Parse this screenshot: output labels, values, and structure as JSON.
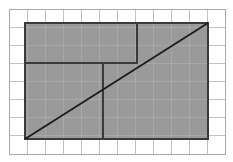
{
  "figure": {
    "type": "geometry-diagram",
    "canvas": {
      "width": 233,
      "height": 162,
      "background": "#ffffff"
    }
  },
  "colors": {
    "background": "#ffffff",
    "grid_line": "#b9b9b9",
    "grid_border": "#9d9d9d",
    "shade_fill": "#9a9a9a",
    "dark_line": "#3a3a3a",
    "diagonal_line": "#1c1c1c"
  },
  "grid": {
    "x_start": 9,
    "y_start": 9,
    "x_end": 225,
    "y_end": 154,
    "cell_width": 18.0,
    "cell_height": 18.125,
    "columns": 12,
    "rows": 8,
    "line_width": 0.8,
    "show": true,
    "vertical_lines": [
      9,
      27,
      45,
      63,
      81,
      99,
      117,
      135,
      153,
      171,
      189,
      207,
      225
    ],
    "horizontal_lines": [
      9,
      27.1,
      45.3,
      63.4,
      81.5,
      99.6,
      117.8,
      135.9,
      154
    ]
  },
  "shaded_rectangle": {
    "label": "large-shaded-rectangle",
    "x": 25,
    "y": 23,
    "width": 183,
    "height": 116,
    "fill": "#9a9a9a",
    "stroke": "#3a3a3a",
    "stroke_width": 1.6
  },
  "inner_rectangles": [
    {
      "label": "upper-inscribed-rectangle",
      "x": 25,
      "y": 23,
      "width": 112,
      "height": 40,
      "stroke": "#3a3a3a",
      "stroke_width": 1.6,
      "fill": "none"
    },
    {
      "label": "lower-inscribed-rectangle",
      "x": 25,
      "y": 63,
      "width": 78,
      "height": 76,
      "stroke": "#3a3a3a",
      "stroke_width": 1.6,
      "fill": "none"
    }
  ],
  "diagonal": {
    "label": "diagonal-line",
    "x1": 25,
    "y1": 139,
    "x2": 208,
    "y2": 23,
    "stroke": "#1c1c1c",
    "stroke_width": 1.8
  },
  "outer_border": {
    "x": 9,
    "y": 9,
    "width": 216,
    "height": 145,
    "stroke": "#9d9d9d",
    "stroke_width": 1.0
  }
}
